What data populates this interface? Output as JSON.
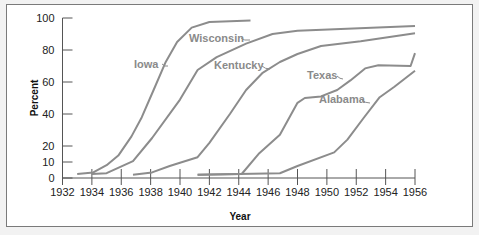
{
  "chart_data": {
    "type": "line",
    "title": "",
    "xlabel": "Year",
    "ylabel": "Percent",
    "xlim": [
      1932,
      1956
    ],
    "ylim": [
      0,
      100
    ],
    "x_ticks": [
      1932,
      1934,
      1936,
      1938,
      1940,
      1942,
      1944,
      1946,
      1948,
      1950,
      1952,
      1954,
      1956
    ],
    "y_ticks": [
      0,
      10,
      20,
      40,
      60,
      80,
      100
    ],
    "grid": false,
    "legend": "inline labels",
    "series": [
      {
        "name": "Iowa",
        "x": [
          1933,
          1934.1,
          1935,
          1935.8,
          1936.7,
          1937.4,
          1938.2,
          1939,
          1939.8,
          1940.8,
          1942,
          1944.8
        ],
        "y": [
          2.5,
          3.5,
          8,
          14,
          26,
          38,
          55,
          72,
          85,
          94,
          97.5,
          98.5
        ]
      },
      {
        "name": "Wisconsin",
        "x": [
          1934,
          1935,
          1936.8,
          1938.1,
          1940,
          1941.2,
          1942.5,
          1944.5,
          1946.3,
          1948,
          1956
        ],
        "y": [
          2.5,
          3,
          10.5,
          25,
          49,
          67.5,
          75.5,
          84,
          90,
          92,
          95
        ]
      },
      {
        "name": "Kentucky",
        "x": [
          1936.8,
          1938.1,
          1939.3,
          1940,
          1941.2,
          1942,
          1943.4,
          1944.5,
          1945.6,
          1946.8,
          1948,
          1949.6,
          1952.3,
          1956
        ],
        "y": [
          2,
          3.5,
          7.5,
          9.5,
          13,
          22,
          40,
          55,
          65.5,
          72.5,
          77.5,
          82.5,
          85.5,
          90.5
        ]
      },
      {
        "name": "Texas",
        "x": [
          1941.2,
          1944.2,
          1945.4,
          1946.8,
          1948,
          1948.5,
          1949.6,
          1950.7,
          1951.6,
          1952.6,
          1953.5,
          1955.7,
          1956
        ],
        "y": [
          2,
          2.5,
          15.5,
          27,
          47,
          50,
          51,
          55,
          61,
          68.5,
          70.5,
          70,
          78
        ]
      },
      {
        "name": "Alabama",
        "x": [
          1941.2,
          1946.8,
          1948,
          1950.5,
          1951.4,
          1952.5,
          1953.6,
          1954.6,
          1956
        ],
        "y": [
          2,
          3,
          7.5,
          16,
          24,
          37.5,
          50.5,
          57,
          67
        ]
      }
    ],
    "annotations": [
      {
        "text": "Iowa",
        "series": "Iowa"
      },
      {
        "text": "Wisconsin",
        "series": "Wisconsin"
      },
      {
        "text": "Kentucky",
        "series": "Kentucky"
      },
      {
        "text": "Texas",
        "series": "Texas"
      },
      {
        "text": "Alabama",
        "series": "Alabama"
      }
    ]
  }
}
